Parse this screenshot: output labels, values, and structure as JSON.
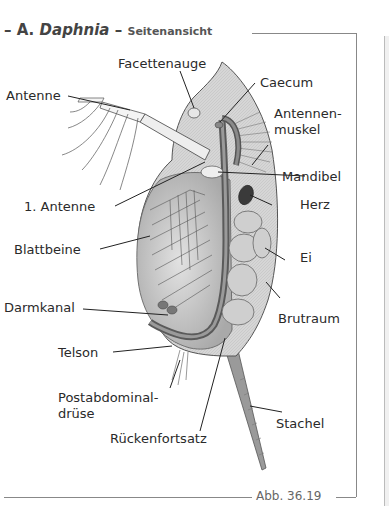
{
  "figure": {
    "title_prefix": "–",
    "title_letter": "A.",
    "title_genus": "Daphnia",
    "title_sep": "–",
    "title_view": "Seitenansicht",
    "caption": "Abb. 36.19"
  },
  "labels": {
    "facettenauge": "Facettenauge",
    "caecum": "Caecum",
    "antenne": "Antenne",
    "antennenmuskel_1": "Antennen-",
    "antennenmuskel_2": "muskel",
    "mandibel": "Mandibel",
    "antenne1": "1. Antenne",
    "herz": "Herz",
    "blattbeine": "Blattbeine",
    "ei": "Ei",
    "darmkanal": "Darmkanal",
    "brutraum": "Brutraum",
    "telson": "Telson",
    "postabdominal_1": "Postabdominal-",
    "postabdominal_2": "drüse",
    "stachel": "Stachel",
    "rueckenfortsatz": "Rückenfortsatz"
  },
  "colors": {
    "carapace": "#d9d9d9",
    "carapace_dark": "#a8a8a8",
    "inner": "#c4c4c4",
    "gut": "#7a7a7a",
    "heart": "#3a3a3a",
    "egg": "#cfcfcf",
    "frame": "#888888"
  }
}
